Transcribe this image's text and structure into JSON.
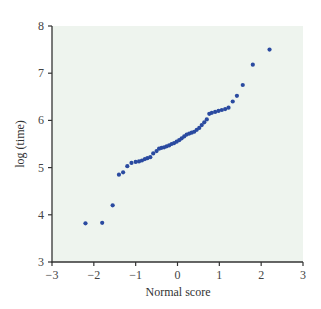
{
  "chart_data": {
    "type": "scatter",
    "title": "",
    "xlabel": "Normal score",
    "ylabel": "log (time)",
    "xlim": [
      -3,
      3
    ],
    "ylim": [
      3,
      8
    ],
    "xticks": [
      -3,
      -2,
      -1,
      0,
      1,
      2,
      3
    ],
    "yticks": [
      3,
      4,
      5,
      6,
      7,
      8
    ],
    "xtick_labels": [
      "−3",
      "−2",
      "−1",
      "0",
      "1",
      "2",
      "3"
    ],
    "ytick_labels": [
      "3",
      "4",
      "5",
      "6",
      "7",
      "8"
    ],
    "grid": false,
    "legend": null,
    "colors": {
      "panel_bg": "#eef4ee",
      "points": "#2a4aa0",
      "axis": "#333333"
    },
    "series": [
      {
        "name": "observations",
        "x": [
          -2.2,
          -1.8,
          -1.55,
          -1.4,
          -1.3,
          -1.2,
          -1.1,
          -1.0,
          -0.92,
          -0.85,
          -0.78,
          -0.72,
          -0.65,
          -0.58,
          -0.5,
          -0.44,
          -0.38,
          -0.32,
          -0.26,
          -0.2,
          -0.14,
          -0.08,
          -0.02,
          0.04,
          0.1,
          0.16,
          0.22,
          0.28,
          0.34,
          0.4,
          0.46,
          0.52,
          0.58,
          0.64,
          0.7,
          0.76,
          0.82,
          0.9,
          0.98,
          1.06,
          1.14,
          1.22,
          1.32,
          1.42,
          1.56,
          1.8,
          2.2
        ],
        "y": [
          3.82,
          3.83,
          4.2,
          4.85,
          4.9,
          5.03,
          5.1,
          5.12,
          5.13,
          5.15,
          5.18,
          5.2,
          5.22,
          5.3,
          5.35,
          5.4,
          5.42,
          5.43,
          5.45,
          5.47,
          5.5,
          5.52,
          5.55,
          5.58,
          5.62,
          5.66,
          5.7,
          5.72,
          5.74,
          5.76,
          5.8,
          5.84,
          5.9,
          5.96,
          6.02,
          6.14,
          6.16,
          6.18,
          6.2,
          6.22,
          6.24,
          6.27,
          6.4,
          6.52,
          6.75,
          7.18,
          7.5
        ]
      }
    ]
  }
}
